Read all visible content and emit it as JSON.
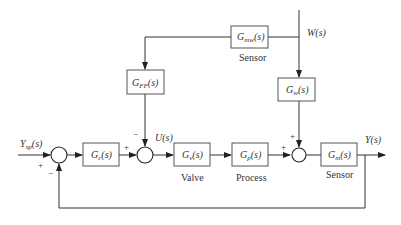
{
  "diagram": {
    "type": "feedforward-feedback control block diagram",
    "blocks": {
      "controller": {
        "symbol": "G",
        "sub": "c",
        "suffix": "(s)"
      },
      "valve": {
        "symbol": "G",
        "sub": "v",
        "suffix": "(s)",
        "caption": "Valve"
      },
      "process": {
        "symbol": "G",
        "sub": "p",
        "suffix": "(s)",
        "caption": "Process"
      },
      "sensor": {
        "symbol": "G",
        "sub": "m",
        "suffix": "(s)",
        "caption": "Sensor"
      },
      "disturbance": {
        "symbol": "G",
        "sub": "w",
        "suffix": "(s)"
      },
      "disturbance_sensor": {
        "symbol": "G",
        "sub": "mw",
        "suffix": "(s)",
        "caption": "Sensor"
      },
      "feedforward": {
        "symbol": "G",
        "sub": "FF",
        "suffix": "(s)"
      }
    },
    "signals": {
      "setpoint": {
        "symbol": "Y",
        "sub": "sp",
        "suffix": "(s)"
      },
      "manipulated": "U(s)",
      "disturbance": "W(s)",
      "output": "Y(s)"
    },
    "signs": {
      "sum1_setpoint": "+",
      "sum1_feedback": "−",
      "sum2_controller": "+",
      "sum2_feedforward": "−",
      "sum3_process": "+",
      "sum3_disturbance": "+"
    }
  }
}
